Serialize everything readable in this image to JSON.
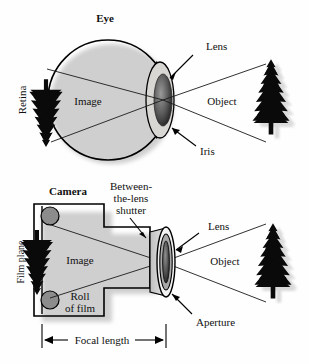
{
  "figure": {
    "background_color": "#fefefe",
    "ink_color": "#000000",
    "gray_fill": "#8c8c8c",
    "iris_color": "#d4d2cf",
    "panels": [
      {
        "id": "eye",
        "title": "Eye",
        "labels": {
          "retina": "Retina",
          "image": "Image",
          "lens": "Lens",
          "iris": "Iris",
          "object": "Object"
        }
      },
      {
        "id": "camera",
        "title": "Camera",
        "labels": {
          "film_plane": "Film plane",
          "image": "Image",
          "roll_of_film_line1": "Roll",
          "roll_of_film_line2": "of film",
          "shutter_line1": "Between-",
          "shutter_line2": "the-lens",
          "shutter_line3": "shutter",
          "lens": "Lens",
          "aperture": "Aperture",
          "object": "Object",
          "focal_length": "Focal length"
        }
      }
    ]
  }
}
